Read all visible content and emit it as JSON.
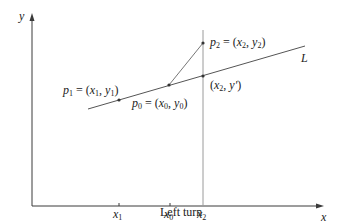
{
  "diagram": {
    "title": "Left turn",
    "axes": {
      "x_label": "x",
      "y_label": "y"
    },
    "ticks": [
      {
        "label": "x",
        "sub": "1",
        "x": 119
      },
      {
        "label": "x",
        "sub": "0",
        "x": 170
      },
      {
        "label": "x",
        "sub": "2",
        "x": 203
      }
    ],
    "points": {
      "p1": {
        "name": "p",
        "name_sub": "1",
        "eq": " = (",
        "a": "x",
        "a_sub": "1",
        "sep": ", ",
        "b": "y",
        "b_sub": "1",
        "end": ")"
      },
      "p0": {
        "name": "p",
        "name_sub": "0",
        "eq": " = (",
        "a": "x",
        "a_sub": "0",
        "sep": ", ",
        "b": "y",
        "b_sub": "0",
        "end": ")"
      },
      "p2": {
        "name": "p",
        "name_sub": "2",
        "eq": " = (",
        "a": "x",
        "a_sub": "2",
        "sep": ", ",
        "b": "y",
        "b_sub": "2",
        "end": ")"
      },
      "proj": {
        "open": "(",
        "a": "x",
        "a_sub": "2",
        "sep": ", ",
        "b": "y′",
        "end": ")"
      }
    },
    "line_label": "L",
    "colors": {
      "axis": "#3a3a3a",
      "line": "#555555",
      "vertical": "#9a9a9a",
      "text": "#222222"
    }
  }
}
